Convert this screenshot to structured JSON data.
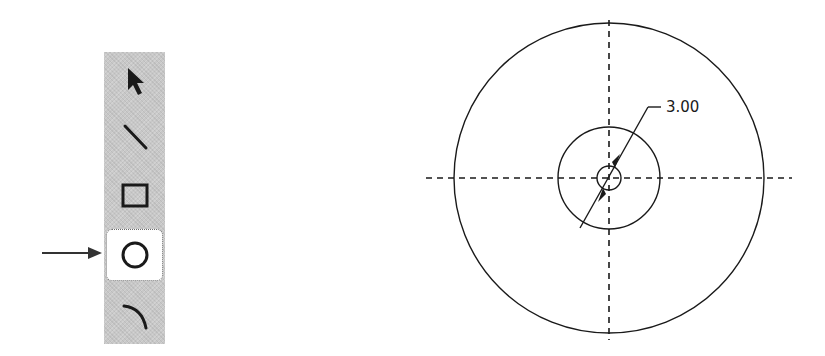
{
  "toolbar": {
    "tools": [
      {
        "id": "select",
        "label": "Select",
        "icon": "arrow-cursor-icon",
        "selected": false
      },
      {
        "id": "line",
        "label": "Line",
        "icon": "line-icon",
        "selected": false
      },
      {
        "id": "rectangle",
        "label": "Rectangle",
        "icon": "rectangle-icon",
        "selected": false
      },
      {
        "id": "circle",
        "label": "Circle",
        "icon": "circle-icon",
        "selected": true
      },
      {
        "id": "arc",
        "label": "Arc",
        "icon": "arc-icon",
        "selected": false
      }
    ],
    "background": "#c8c8c8"
  },
  "callout": {
    "target_tool": "circle",
    "icon": "pointer-arrow-icon"
  },
  "drawing": {
    "center": {
      "x": 609,
      "y": 178
    },
    "circles": [
      {
        "name": "outer-circle",
        "radius": 155
      },
      {
        "name": "middle-circle",
        "radius": 51
      },
      {
        "name": "inner-circle",
        "radius": 12
      }
    ],
    "centerlines": {
      "horizontal": {
        "x1": 426,
        "x2": 792
      },
      "vertical": {
        "y1": 20,
        "y2": 340
      }
    },
    "dimension": {
      "value": "3.00",
      "type": "diameter"
    },
    "stroke_color": "#1a1a1a"
  }
}
